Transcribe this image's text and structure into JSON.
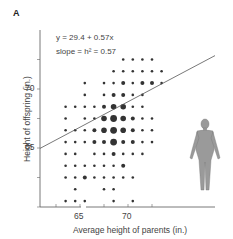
{
  "panel_label": "A",
  "equation": "y = 29.4 + 0.57x",
  "slope_text": "slope = h² = 0.57",
  "xlabel": "Average height of parents (in.)",
  "ylabel": "Height of offspring (in.)",
  "x_ticks": [
    {
      "label": "65",
      "px": 67
    },
    {
      "label": "70",
      "px": 115
    }
  ],
  "y_ticks": [
    {
      "label": "70",
      "py": 89
    },
    {
      "label": "65",
      "py": 148
    }
  ],
  "chart_data": {
    "type": "scatter",
    "title": "",
    "xlabel": "Average height of parents (in.)",
    "ylabel": "Height of offspring (in.)",
    "xlim": [
      62,
      75
    ],
    "ylim": [
      61,
      73
    ],
    "x_ticks": [
      65,
      70
    ],
    "y_ticks": [
      65,
      70
    ],
    "regression": {
      "intercept": 29.4,
      "slope": 0.57,
      "label": "y = 29.4 + 0.57x",
      "annotation": "slope = h² = 0.57"
    },
    "note": "Bubble scatter: dot size proportional to count of families at each (parent, offspring) height combination",
    "points_size_scale": "1=small, 2=medium, 3=large, 4=largest",
    "points": [
      {
        "x": 69.5,
        "y": 72.5,
        "s": 1
      },
      {
        "x": 70.5,
        "y": 72.5,
        "s": 1
      },
      {
        "x": 71.5,
        "y": 72.5,
        "s": 1
      },
      {
        "x": 72.5,
        "y": 72.5,
        "s": 1
      },
      {
        "x": 68.5,
        "y": 71.5,
        "s": 1
      },
      {
        "x": 69.5,
        "y": 71.5,
        "s": 1
      },
      {
        "x": 70.5,
        "y": 71.5,
        "s": 1
      },
      {
        "x": 71.5,
        "y": 71.5,
        "s": 1
      },
      {
        "x": 72.5,
        "y": 71.5,
        "s": 1
      },
      {
        "x": 73.5,
        "y": 71.5,
        "s": 1
      },
      {
        "x": 65.5,
        "y": 70.5,
        "s": 1
      },
      {
        "x": 67.5,
        "y": 70.5,
        "s": 1
      },
      {
        "x": 68.5,
        "y": 70.5,
        "s": 1
      },
      {
        "x": 69.5,
        "y": 70.5,
        "s": 2
      },
      {
        "x": 70.5,
        "y": 70.5,
        "s": 1
      },
      {
        "x": 71.5,
        "y": 70.5,
        "s": 2
      },
      {
        "x": 72.5,
        "y": 70.5,
        "s": 2
      },
      {
        "x": 73.5,
        "y": 70.5,
        "s": 1
      },
      {
        "x": 65.5,
        "y": 69.5,
        "s": 1
      },
      {
        "x": 67.5,
        "y": 69.5,
        "s": 1
      },
      {
        "x": 68.5,
        "y": 69.5,
        "s": 2
      },
      {
        "x": 69.5,
        "y": 69.5,
        "s": 2
      },
      {
        "x": 70.5,
        "y": 69.5,
        "s": 1
      },
      {
        "x": 71.5,
        "y": 69.5,
        "s": 1
      },
      {
        "x": 63.5,
        "y": 68.5,
        "s": 1
      },
      {
        "x": 64.5,
        "y": 68.5,
        "s": 1
      },
      {
        "x": 65.5,
        "y": 68.5,
        "s": 1
      },
      {
        "x": 66.5,
        "y": 68.5,
        "s": 1
      },
      {
        "x": 67.5,
        "y": 68.5,
        "s": 2
      },
      {
        "x": 68.5,
        "y": 68.5,
        "s": 3
      },
      {
        "x": 69.5,
        "y": 68.5,
        "s": 3
      },
      {
        "x": 70.5,
        "y": 68.5,
        "s": 1
      },
      {
        "x": 71.5,
        "y": 68.5,
        "s": 1
      },
      {
        "x": 63.5,
        "y": 67.5,
        "s": 1
      },
      {
        "x": 65.5,
        "y": 67.5,
        "s": 1
      },
      {
        "x": 66.5,
        "y": 67.5,
        "s": 1
      },
      {
        "x": 67.5,
        "y": 67.5,
        "s": 3
      },
      {
        "x": 68.5,
        "y": 67.5,
        "s": 4
      },
      {
        "x": 69.5,
        "y": 67.5,
        "s": 3
      },
      {
        "x": 70.5,
        "y": 67.5,
        "s": 2
      },
      {
        "x": 71.5,
        "y": 67.5,
        "s": 1
      },
      {
        "x": 72.5,
        "y": 67.5,
        "s": 1
      },
      {
        "x": 63.5,
        "y": 66.5,
        "s": 1
      },
      {
        "x": 64.5,
        "y": 66.5,
        "s": 1
      },
      {
        "x": 65.5,
        "y": 66.5,
        "s": 1
      },
      {
        "x": 66.5,
        "y": 66.5,
        "s": 2
      },
      {
        "x": 67.5,
        "y": 66.5,
        "s": 3
      },
      {
        "x": 68.5,
        "y": 66.5,
        "s": 4
      },
      {
        "x": 69.5,
        "y": 66.5,
        "s": 3
      },
      {
        "x": 70.5,
        "y": 66.5,
        "s": 2
      },
      {
        "x": 71.5,
        "y": 66.5,
        "s": 1
      },
      {
        "x": 72.5,
        "y": 66.5,
        "s": 1
      },
      {
        "x": 63.5,
        "y": 65.5,
        "s": 1
      },
      {
        "x": 64.5,
        "y": 65.5,
        "s": 1
      },
      {
        "x": 65.5,
        "y": 65.5,
        "s": 1
      },
      {
        "x": 66.5,
        "y": 65.5,
        "s": 2
      },
      {
        "x": 67.5,
        "y": 65.5,
        "s": 2
      },
      {
        "x": 68.5,
        "y": 65.5,
        "s": 4
      },
      {
        "x": 69.5,
        "y": 65.5,
        "s": 2
      },
      {
        "x": 70.5,
        "y": 65.5,
        "s": 2
      },
      {
        "x": 71.5,
        "y": 65.5,
        "s": 1
      },
      {
        "x": 72.5,
        "y": 65.5,
        "s": 1
      },
      {
        "x": 63.5,
        "y": 64.5,
        "s": 1
      },
      {
        "x": 64.5,
        "y": 64.5,
        "s": 1
      },
      {
        "x": 66.5,
        "y": 64.5,
        "s": 1
      },
      {
        "x": 67.5,
        "y": 64.5,
        "s": 1
      },
      {
        "x": 68.5,
        "y": 64.5,
        "s": 2
      },
      {
        "x": 69.5,
        "y": 64.5,
        "s": 1
      },
      {
        "x": 70.5,
        "y": 64.5,
        "s": 1
      },
      {
        "x": 71.5,
        "y": 64.5,
        "s": 1
      },
      {
        "x": 63.5,
        "y": 63.5,
        "s": 1
      },
      {
        "x": 64.5,
        "y": 63.5,
        "s": 1
      },
      {
        "x": 65.5,
        "y": 63.5,
        "s": 1
      },
      {
        "x": 66.5,
        "y": 63.5,
        "s": 1
      },
      {
        "x": 67.5,
        "y": 63.5,
        "s": 1
      },
      {
        "x": 68.5,
        "y": 63.5,
        "s": 1
      },
      {
        "x": 69.5,
        "y": 63.5,
        "s": 2
      },
      {
        "x": 63.5,
        "y": 62.5,
        "s": 1
      },
      {
        "x": 64.5,
        "y": 62.5,
        "s": 1
      },
      {
        "x": 65.5,
        "y": 62.5,
        "s": 2
      },
      {
        "x": 66.5,
        "y": 62.5,
        "s": 1
      },
      {
        "x": 67.5,
        "y": 62.5,
        "s": 1
      },
      {
        "x": 68.5,
        "y": 62.5,
        "s": 1
      },
      {
        "x": 69.5,
        "y": 62.5,
        "s": 1
      },
      {
        "x": 70.5,
        "y": 62.5,
        "s": 1
      },
      {
        "x": 64.5,
        "y": 61.5,
        "s": 1
      },
      {
        "x": 67.5,
        "y": 61.5,
        "s": 1
      },
      {
        "x": 68.5,
        "y": 61.5,
        "s": 1
      },
      {
        "x": 63.5,
        "y": 60.5,
        "s": 1
      },
      {
        "x": 64.5,
        "y": 60.5,
        "s": 1
      },
      {
        "x": 65.5,
        "y": 60.5,
        "s": 1
      },
      {
        "x": 68.5,
        "y": 60.5,
        "s": 1
      },
      {
        "x": 70.5,
        "y": 60.5,
        "s": 1
      }
    ]
  },
  "colors": {
    "axis": "#444444",
    "dot": "#333333",
    "line": "#555555",
    "text": "#444444"
  },
  "illustration": "human-figure-icon"
}
